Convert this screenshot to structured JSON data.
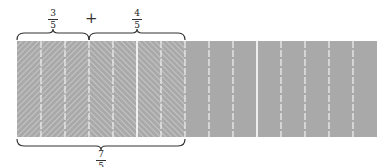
{
  "diagram": {
    "type": "fraction-addition-bar-model",
    "expression": {
      "left": {
        "numerator": "3",
        "denominator": "5"
      },
      "operator": "+",
      "right": {
        "numerator": "4",
        "denominator": "5"
      },
      "result": {
        "numerator": "7",
        "denominator": "5"
      }
    },
    "bar": {
      "total_parts": 15,
      "parts_per_whole": 5,
      "first_addend_parts": 3,
      "second_addend_parts": 4,
      "unshaded_parts": 8
    },
    "colors": {
      "fill": "#a9a9a9",
      "hatch": "#c8c8c8",
      "divider": "#ffffff",
      "brace": "#333333"
    }
  }
}
